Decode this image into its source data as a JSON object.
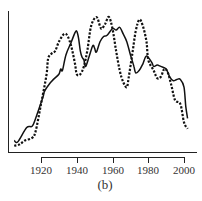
{
  "chart_data": {
    "type": "line",
    "title": "",
    "caption": "(b)",
    "xlabel": "",
    "ylabel": "",
    "xlim": [
      1905,
      2002
    ],
    "ylim": [
      0,
      1
    ],
    "grid": false,
    "legend": null,
    "x_ticks": [
      1920,
      1940,
      1960,
      1980,
      2000
    ],
    "x_tick_labels": [
      "1920",
      "1940",
      "1960",
      "1980",
      "2000"
    ],
    "series": [
      {
        "name": "solid",
        "style": "solid",
        "color": "#111111",
        "x": [
          1905,
          1907,
          1912,
          1915,
          1917,
          1921,
          1922,
          1925,
          1927,
          1930,
          1931,
          1932,
          1934,
          1937,
          1939,
          1940,
          1941,
          1942,
          1943,
          1944,
          1945,
          1947,
          1949,
          1950,
          1951,
          1953,
          1955,
          1957,
          1960,
          1962,
          1964,
          1966,
          1968,
          1970,
          1972,
          1973,
          1975,
          1977,
          1979,
          1982,
          1983,
          1985,
          1987,
          1990,
          1992,
          1994,
          1996,
          1998,
          2000,
          2001,
          2002
        ],
        "y": [
          0.05,
          0.04,
          0.15,
          0.16,
          0.22,
          0.38,
          0.43,
          0.49,
          0.52,
          0.56,
          0.6,
          0.59,
          0.71,
          0.81,
          0.88,
          0.89,
          0.84,
          0.74,
          0.69,
          0.67,
          0.62,
          0.7,
          0.78,
          0.76,
          0.73,
          0.81,
          0.85,
          0.86,
          0.91,
          0.9,
          0.92,
          0.87,
          0.81,
          0.71,
          0.62,
          0.57,
          0.59,
          0.64,
          0.7,
          0.65,
          0.62,
          0.63,
          0.62,
          0.6,
          0.54,
          0.51,
          0.52,
          0.52,
          0.46,
          0.31,
          0.22
        ]
      },
      {
        "name": "dotted",
        "style": "dotted",
        "color": "#111111",
        "x": [
          1905,
          1908,
          1911,
          1915,
          1917,
          1920,
          1923,
          1924,
          1926,
          1928,
          1930,
          1933,
          1935,
          1937,
          1939,
          1940,
          1942,
          1944,
          1946,
          1948,
          1951,
          1953,
          1954,
          1956,
          1958,
          1960,
          1962,
          1964,
          1966,
          1968,
          1969,
          1971,
          1973,
          1975,
          1977,
          1979,
          1980,
          1983,
          1985,
          1987,
          1989,
          1991,
          1993,
          1995,
          1998,
          2000,
          2002
        ],
        "y": [
          0.01,
          0.02,
          0.05,
          0.07,
          0.12,
          0.33,
          0.55,
          0.68,
          0.72,
          0.74,
          0.81,
          0.87,
          0.85,
          0.77,
          0.64,
          0.56,
          0.56,
          0.62,
          0.75,
          0.93,
          1.0,
          0.93,
          0.91,
          0.95,
          1.0,
          0.91,
          0.74,
          0.59,
          0.5,
          0.46,
          0.53,
          0.71,
          0.89,
          0.98,
          0.93,
          0.81,
          0.67,
          0.59,
          0.53,
          0.54,
          0.6,
          0.57,
          0.47,
          0.36,
          0.33,
          0.19,
          0.14
        ]
      }
    ]
  },
  "axis": {
    "tick_labels": [
      "1920",
      "1940",
      "1960",
      "1980",
      "2000"
    ]
  },
  "caption": "(b)"
}
